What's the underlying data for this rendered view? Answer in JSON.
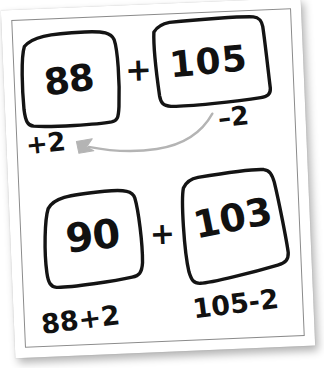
{
  "artboard": {
    "kind": "hand-drawn-worksheet",
    "background_color": "#ffffff",
    "paper_color": "#ffffff",
    "ink_color": "#111111",
    "arrow_color": "#b3b3b3",
    "rotation_deg": -2.4
  },
  "rows": [
    {
      "name": "original-expression",
      "left_box_value": "88",
      "operator": "+",
      "right_box_value": "105",
      "left_annotation": "+2",
      "right_annotation": "–2"
    },
    {
      "name": "adjusted-expression",
      "left_box_value": "90",
      "operator": "+",
      "right_box_value": "103",
      "left_annotation": "88+2",
      "right_annotation": "105-2"
    }
  ],
  "arrow": {
    "name": "transfer-arrow",
    "label": "",
    "direction": "right-to-left",
    "from": "105 box (–2)",
    "to": "88 box (+2)",
    "color": "#b3b3b3"
  },
  "icons": {
    "arrowhead": "arrow-left-icon"
  }
}
